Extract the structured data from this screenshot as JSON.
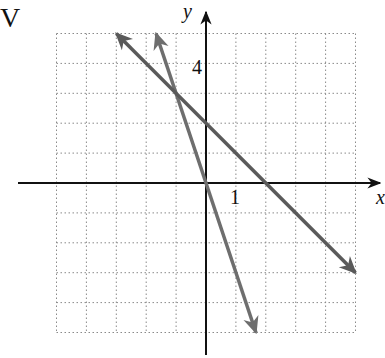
{
  "figure": {
    "corner_label": "V",
    "axis_labels": {
      "x": "x",
      "y": "y"
    },
    "tick_labels": {
      "y_tick": "4",
      "x_tick": "1"
    }
  },
  "chart_data": {
    "type": "line",
    "title": "",
    "xlabel": "x",
    "ylabel": "y",
    "xlim": [
      -5,
      5
    ],
    "ylim": [
      -5,
      5
    ],
    "grid": true,
    "grid_style": "dotted",
    "grid_step": 1,
    "labeled_ticks": {
      "x": [
        1
      ],
      "y": [
        4
      ]
    },
    "series": [
      {
        "name": "y = -3x",
        "equation": "y = -3x",
        "slope": -3,
        "intercept": 0,
        "x": [
          -1.67,
          1.67
        ],
        "y": [
          5,
          -5
        ],
        "arrows": "both",
        "color": "#6e6e6e"
      },
      {
        "name": "y = -x + 2",
        "equation": "y = -x + 2",
        "slope": -1,
        "intercept": 2,
        "x": [
          -3,
          5
        ],
        "y": [
          5,
          -3
        ],
        "arrows": "both",
        "color": "#5a5a5a"
      }
    ],
    "intersection": {
      "x": -1,
      "y": 3
    }
  },
  "colors": {
    "axis": "#111111",
    "grid": "#8a8a8a",
    "line_a": "#6e6e6e",
    "line_b": "#5a5a5a"
  }
}
